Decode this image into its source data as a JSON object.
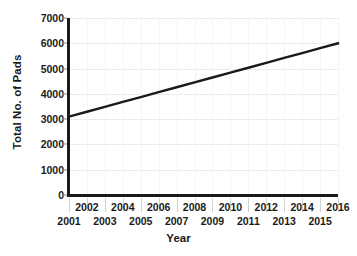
{
  "chart_data": {
    "type": "line",
    "title": "",
    "xlabel": "Year",
    "ylabel": "Total No. of Pads",
    "x": [
      2001,
      2002,
      2003,
      2004,
      2005,
      2006,
      2007,
      2008,
      2009,
      2010,
      2011,
      2012,
      2013,
      2014,
      2015,
      2016
    ],
    "values": [
      3100,
      3293,
      3487,
      3680,
      3873,
      4067,
      4260,
      4453,
      4647,
      4840,
      5033,
      5227,
      5420,
      5613,
      5807,
      6000
    ],
    "series": [
      {
        "name": "Total No. of Pads",
        "values": [
          3100,
          3293,
          3487,
          3680,
          3873,
          4067,
          4260,
          4453,
          4647,
          4840,
          5033,
          5227,
          5420,
          5613,
          5807,
          6000
        ],
        "color": "#1a1a1a"
      }
    ],
    "x_tick_labels": [
      "2001",
      "2002",
      "2003",
      "2004",
      "2005",
      "2006",
      "2007",
      "2008",
      "2009",
      "2010",
      "2011",
      "2012",
      "2013",
      "2014",
      "2015",
      "2016"
    ],
    "y_tick_labels": [
      "0",
      "1000",
      "2000",
      "3000",
      "4000",
      "5000",
      "6000",
      "7000"
    ],
    "y_ticks": [
      0,
      1000,
      2000,
      3000,
      4000,
      5000,
      6000,
      7000
    ],
    "xlim": [
      2001,
      2016
    ],
    "ylim": [
      0,
      7000
    ],
    "grid": true,
    "grid_color": "#ebebeb",
    "legend": false,
    "legend_position": "none",
    "axis_color": "#1a1a1a",
    "background_color": "#ffffff",
    "line_width": 2.4,
    "annotations": []
  }
}
